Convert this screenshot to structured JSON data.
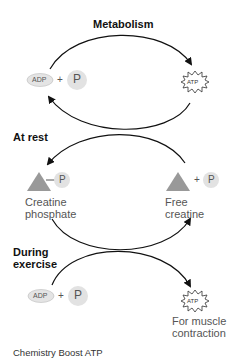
{
  "diagram": {
    "titles": {
      "metabolism": "Metabolism",
      "at_rest": "At rest",
      "during_exercise_line1": "During",
      "during_exercise_line2": "exercise"
    },
    "nodes": {
      "adp_top": {
        "label": "ADP",
        "plus": "+",
        "phosphate": "P"
      },
      "atp_top": {
        "label": "ATP"
      },
      "creatine_phosphate": {
        "phosphate": "P",
        "line1": "Creatine",
        "line2": "phosphate"
      },
      "free_creatine": {
        "plus": "+",
        "phosphate": "P",
        "line1": "Free",
        "line2": "creatine"
      },
      "adp_bottom": {
        "label": "ADP",
        "plus": "+",
        "phosphate": "P"
      },
      "atp_bottom": {
        "label": "ATP",
        "line1": "For muscle",
        "line2": "contraction"
      }
    },
    "colors": {
      "shape_fill": "#999999",
      "circle_fill": "#e2e2e2",
      "arrow": "#111111"
    }
  },
  "caption": "Chemistry Boost ATP"
}
